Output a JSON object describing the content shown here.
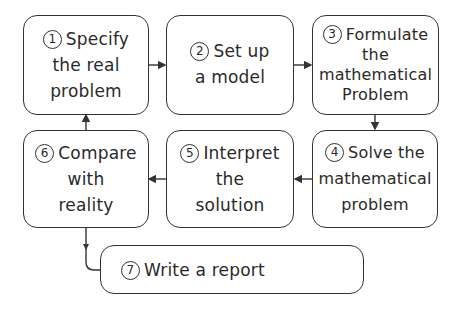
{
  "diagram": {
    "steps": [
      {
        "number": "1",
        "lines": [
          "Specify",
          "the real",
          "problem"
        ]
      },
      {
        "number": "2",
        "lines": [
          "Set up",
          "a model"
        ]
      },
      {
        "number": "3",
        "lines": [
          "Formulate",
          "the",
          "mathematical",
          "Problem"
        ]
      },
      {
        "number": "4",
        "lines": [
          "Solve the",
          "mathematical",
          "problem"
        ]
      },
      {
        "number": "5",
        "lines": [
          "Interpret",
          "the",
          "solution"
        ]
      },
      {
        "number": "6",
        "lines": [
          "Compare",
          "with",
          "reality"
        ]
      },
      {
        "number": "7",
        "lines": [
          "Write a report"
        ]
      }
    ],
    "arrows": [
      {
        "from": "1",
        "to": "2",
        "direction": "right"
      },
      {
        "from": "2",
        "to": "3",
        "direction": "right"
      },
      {
        "from": "3",
        "to": "4",
        "direction": "down"
      },
      {
        "from": "4",
        "to": "5",
        "direction": "left"
      },
      {
        "from": "5",
        "to": "6",
        "direction": "left"
      },
      {
        "from": "6",
        "to": "1",
        "direction": "up"
      },
      {
        "from": "6",
        "to": "7",
        "direction": "down-right"
      }
    ],
    "colors": {
      "stroke": "#333333",
      "background": "#ffffff",
      "text": "#2a2a2a"
    }
  }
}
